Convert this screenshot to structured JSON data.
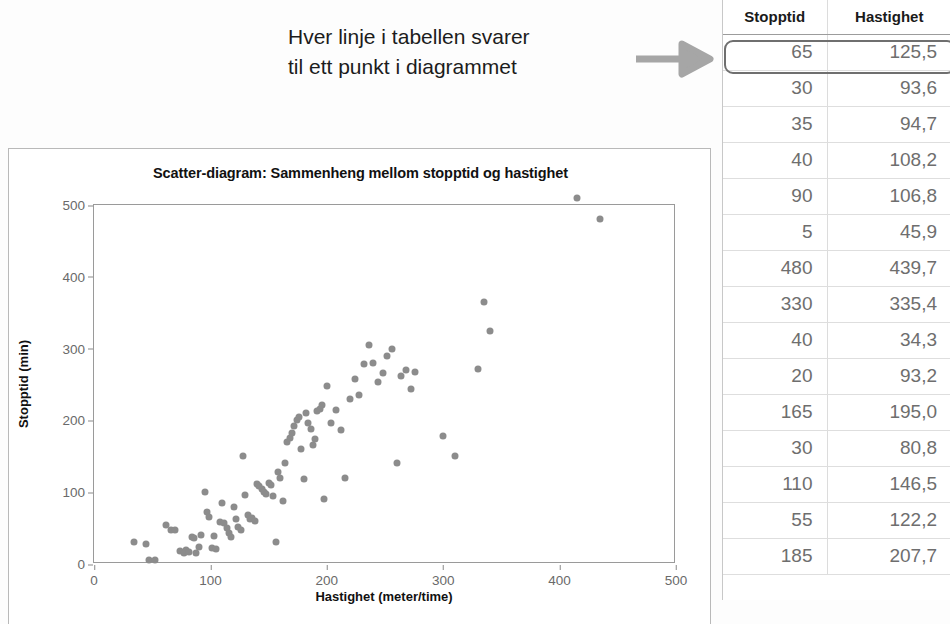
{
  "annotation": {
    "line1": "Hver linje i tabellen svarer",
    "line2": "til ett punkt i diagrammet",
    "arrow_icon": "arrow-right-icon",
    "arrow_color": "#a6a6a6"
  },
  "chart_data": {
    "type": "scatter",
    "title": "Scatter-diagram: Sammenheng mellom stopptid og hastighet",
    "xlabel": "Hastighet (meter/time)",
    "ylabel": "Stopptid (min)",
    "xlim": [
      0,
      500
    ],
    "ylim": [
      0,
      500
    ],
    "xticks": [
      0,
      100,
      200,
      300,
      400,
      500
    ],
    "yticks": [
      0,
      100,
      200,
      300,
      400,
      500
    ],
    "grid": false,
    "legend": null,
    "marker_color": "#8c8c8c",
    "series": [
      {
        "name": "Observasjoner",
        "points": [
          [
            34,
            30
          ],
          [
            45,
            28
          ],
          [
            47,
            5
          ],
          [
            52,
            6
          ],
          [
            62,
            55
          ],
          [
            66,
            48
          ],
          [
            70,
            47
          ],
          [
            74,
            18
          ],
          [
            77,
            16
          ],
          [
            79,
            20
          ],
          [
            82,
            17
          ],
          [
            84,
            37
          ],
          [
            86,
            36
          ],
          [
            88,
            15
          ],
          [
            90,
            24
          ],
          [
            92,
            40
          ],
          [
            95,
            100
          ],
          [
            97,
            72
          ],
          [
            99,
            66
          ],
          [
            101,
            22
          ],
          [
            103,
            39
          ],
          [
            105,
            21
          ],
          [
            108,
            58
          ],
          [
            110,
            85
          ],
          [
            112,
            57
          ],
          [
            114,
            50
          ],
          [
            116,
            43
          ],
          [
            118,
            38
          ],
          [
            120,
            80
          ],
          [
            122,
            62
          ],
          [
            124,
            52
          ],
          [
            126,
            48
          ],
          [
            128,
            150
          ],
          [
            130,
            96
          ],
          [
            132,
            68
          ],
          [
            134,
            63
          ],
          [
            136,
            64
          ],
          [
            138,
            60
          ],
          [
            140,
            112
          ],
          [
            142,
            108
          ],
          [
            144,
            104
          ],
          [
            146,
            100
          ],
          [
            148,
            98
          ],
          [
            150,
            113
          ],
          [
            152,
            110
          ],
          [
            154,
            95
          ],
          [
            156,
            30
          ],
          [
            158,
            128
          ],
          [
            160,
            120
          ],
          [
            162,
            88
          ],
          [
            164,
            140
          ],
          [
            166,
            170
          ],
          [
            168,
            175
          ],
          [
            170,
            182
          ],
          [
            172,
            192
          ],
          [
            174,
            200
          ],
          [
            176,
            205
          ],
          [
            178,
            160
          ],
          [
            180,
            118
          ],
          [
            182,
            210
          ],
          [
            184,
            196
          ],
          [
            186,
            188
          ],
          [
            188,
            166
          ],
          [
            190,
            174
          ],
          [
            192,
            213
          ],
          [
            194,
            216
          ],
          [
            196,
            221
          ],
          [
            198,
            90
          ],
          [
            200,
            248
          ],
          [
            204,
            196
          ],
          [
            208,
            215
          ],
          [
            212,
            186
          ],
          [
            216,
            120
          ],
          [
            220,
            230
          ],
          [
            224,
            258
          ],
          [
            228,
            236
          ],
          [
            232,
            278
          ],
          [
            236,
            305
          ],
          [
            240,
            280
          ],
          [
            244,
            253
          ],
          [
            248,
            266
          ],
          [
            252,
            290
          ],
          [
            256,
            300
          ],
          [
            260,
            140
          ],
          [
            264,
            262
          ],
          [
            268,
            270
          ],
          [
            272,
            244
          ],
          [
            276,
            268
          ],
          [
            300,
            178
          ],
          [
            310,
            150
          ],
          [
            330,
            272
          ],
          [
            335,
            365
          ],
          [
            340,
            325
          ],
          [
            415,
            510
          ],
          [
            435,
            480
          ]
        ]
      }
    ]
  },
  "table": {
    "columns": [
      "Stopptid",
      "Hastighet"
    ],
    "highlighted_row_index": 0,
    "rows": [
      [
        "65",
        "125,5"
      ],
      [
        "30",
        "93,6"
      ],
      [
        "35",
        "94,7"
      ],
      [
        "40",
        "108,2"
      ],
      [
        "90",
        "106,8"
      ],
      [
        "5",
        "45,9"
      ],
      [
        "480",
        "439,7"
      ],
      [
        "330",
        "335,4"
      ],
      [
        "40",
        "34,3"
      ],
      [
        "20",
        "93,2"
      ],
      [
        "165",
        "195,0"
      ],
      [
        "30",
        "80,8"
      ],
      [
        "110",
        "146,5"
      ],
      [
        "55",
        "122,2"
      ],
      [
        "185",
        "207,7"
      ]
    ]
  }
}
